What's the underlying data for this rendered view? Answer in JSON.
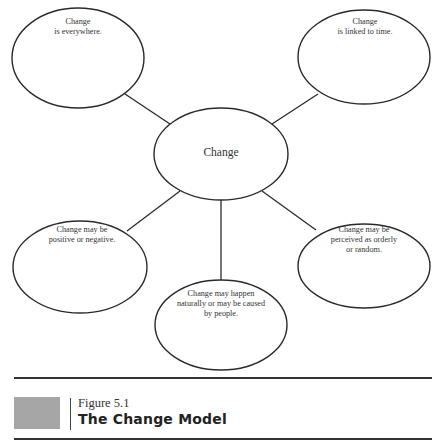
{
  "diagram": {
    "center": {
      "label": "Change"
    },
    "nodes": [
      {
        "id": "top-left",
        "text": "Change\nis everywhere."
      },
      {
        "id": "top-right",
        "text": "Change\nis linked to time."
      },
      {
        "id": "bottom-left",
        "text": "Change may be\npositive or negative."
      },
      {
        "id": "bottom-center",
        "text": "Change may happen\nnaturally or may be caused\nby people."
      },
      {
        "id": "bottom-right",
        "text": "Change may be\nperceived as orderly\nor random."
      }
    ]
  },
  "caption": {
    "figure_number": "Figure 5.1",
    "title": "The Change Model"
  },
  "colors": {
    "stroke": "#2a2a2a",
    "swatch": "#a6a6a6"
  }
}
